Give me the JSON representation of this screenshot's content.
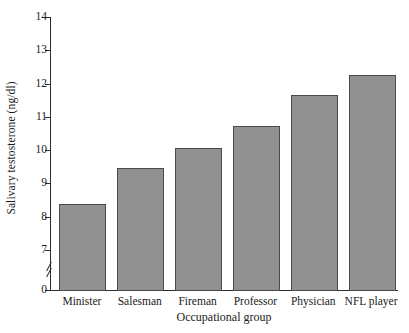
{
  "chart_data": {
    "type": "bar",
    "title": "",
    "xlabel": "Occupational group",
    "ylabel": "Salivary testosterone (ng/dl)",
    "categories": [
      "Minister",
      "Salesman",
      "Fireman",
      "Professor",
      "Physician",
      "NFL player"
    ],
    "values": [
      8.4,
      9.5,
      10.1,
      10.75,
      11.7,
      12.3
    ],
    "ylim": [
      7,
      14
    ],
    "yticks": [
      0,
      7,
      8,
      9,
      10,
      11,
      12,
      13,
      14
    ],
    "ytick_labels": [
      "0",
      "7",
      "8",
      "9",
      "10",
      "11",
      "12",
      "13",
      "14"
    ],
    "grid": false,
    "legend": false,
    "axis_break": true,
    "bar_color": "#919191",
    "bar_edge_color": "#4a4a4a",
    "axis_color": "#2b2b2b",
    "background": "#ffffff"
  }
}
